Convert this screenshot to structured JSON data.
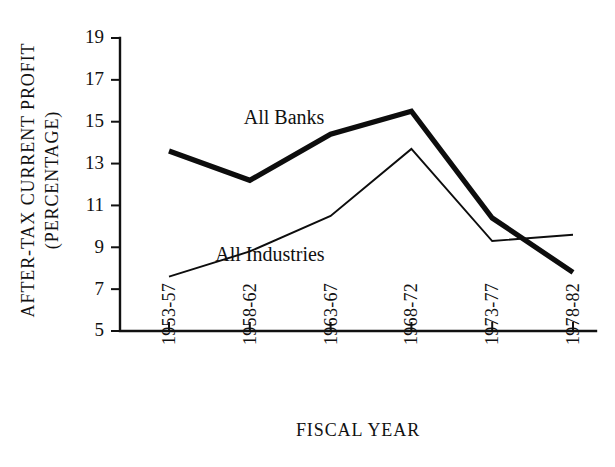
{
  "chart_data": {
    "type": "line",
    "title": "",
    "subtitle": "",
    "xlabel": "FISCAL YEAR",
    "ylabel": "AFTER-TAX CURRENT PROFIT (PERCENTAGE)",
    "ylabel_line1": "AFTER-TAX CURRENT PROFIT",
    "ylabel_line2": "(PERCENTAGE)",
    "categories": [
      "1953-57",
      "1958-62",
      "1963-67",
      "1968-72",
      "1973-77",
      "1978-82"
    ],
    "ylim": [
      5,
      19
    ],
    "ytick_labels": [
      "19",
      "17",
      "15",
      "13",
      "11",
      "9",
      "7",
      "5"
    ],
    "ytick_values": [
      19,
      17,
      15,
      13,
      11,
      9,
      7,
      5
    ],
    "grid": false,
    "legend_position": "inline-annotation",
    "series": [
      {
        "name": "All Banks",
        "values": [
          13.6,
          12.2,
          14.4,
          15.5,
          10.4,
          7.8
        ],
        "style": "thick",
        "color": "#0d0d0d"
      },
      {
        "name": "All Industries",
        "values": [
          7.6,
          8.8,
          10.5,
          13.7,
          9.3,
          9.6
        ],
        "style": "thin",
        "color": "#0d0d0d"
      }
    ],
    "annotations": [
      {
        "text": "All Banks",
        "x_frac": 0.26,
        "y_value": 14.9
      },
      {
        "text": "All Industries",
        "x_frac": 0.2,
        "y_value": 8.35
      }
    ]
  }
}
